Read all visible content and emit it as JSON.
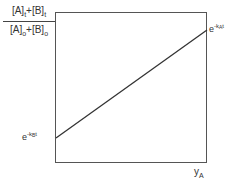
{
  "diagram": {
    "y_axis_label": {
      "numerator": {
        "a": "[A]",
        "a_sub": "t",
        "plus": "+",
        "b": "[B]",
        "b_sub": "t"
      },
      "denominator": {
        "a": "[A]",
        "a_sub": "o",
        "plus": "+",
        "b": "[B]",
        "b_sub": "o"
      }
    },
    "x_axis_label": {
      "base": "y",
      "sub": "A"
    },
    "left_value_label": {
      "base": "e",
      "exp_prefix": "-k",
      "exp_sub": "B",
      "exp_suffix": "t"
    },
    "right_value_label": {
      "base": "e",
      "exp_prefix": "-k",
      "exp_sub": "A",
      "exp_suffix": "t"
    },
    "line": {
      "from": [
        56,
        138
      ],
      "to": [
        207,
        30
      ],
      "color": "#333333"
    },
    "frame": {
      "x": 55,
      "y": 12,
      "width": 152,
      "height": 150,
      "color": "#555555"
    }
  }
}
